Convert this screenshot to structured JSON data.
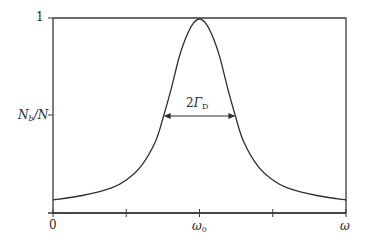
{
  "chart_data": {
    "type": "line",
    "title": "",
    "xlabel": "ω",
    "ylabel": "N_b/N",
    "x_tick_labels": [
      "0",
      "ω0",
      "ω"
    ],
    "y_tick_labels": [
      "1",
      "N_b/N"
    ],
    "annotation": "2Γ_D",
    "x_range": [
      0,
      2
    ],
    "ylim": [
      0,
      1
    ],
    "peak_x": 1.0,
    "peak_y": 1.0,
    "baseline_y": 0.067,
    "half_max_y": 0.5,
    "half_width": 0.245,
    "grid": false,
    "frame": "box",
    "series": [
      {
        "name": "line profile",
        "x": [
          0.0,
          0.2,
          0.4,
          0.5,
          0.6,
          0.7,
          0.755,
          0.8,
          0.86,
          0.9,
          0.95,
          1.0,
          1.05,
          1.1,
          1.14,
          1.2,
          1.245,
          1.3,
          1.4,
          1.5,
          1.6,
          1.8,
          2.0
        ],
        "y": [
          0.067,
          0.09,
          0.13,
          0.17,
          0.24,
          0.37,
          0.5,
          0.62,
          0.8,
          0.89,
          0.97,
          1.0,
          0.97,
          0.89,
          0.8,
          0.62,
          0.5,
          0.37,
          0.24,
          0.17,
          0.13,
          0.09,
          0.067
        ]
      }
    ]
  },
  "labels": {
    "y_top": "1",
    "y_mid_main": "N",
    "y_mid_sub": "b",
    "y_mid_tail": "/N",
    "x_zero": "0",
    "x_center_main": "ω",
    "x_center_sub": "0",
    "x_end": "ω",
    "width_prefix": "2",
    "width_main": "Γ",
    "width_sub": "D"
  },
  "colors": {
    "axis": "#3a3a3a",
    "curve": "#2f2f2f",
    "text": "#2a2a2a"
  }
}
